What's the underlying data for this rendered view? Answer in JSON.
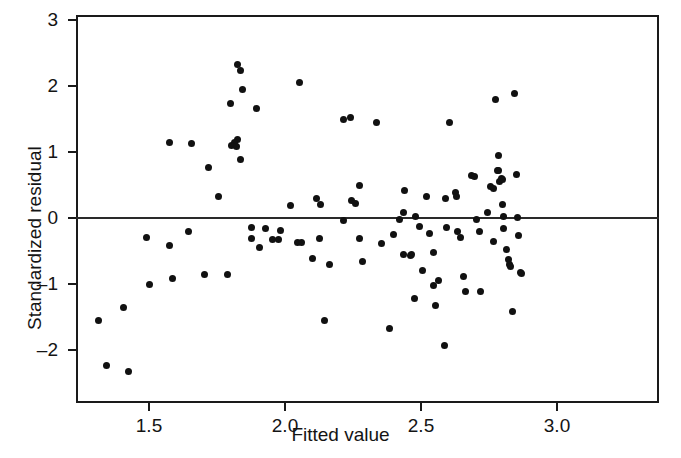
{
  "chart_data": {
    "type": "scatter",
    "title": "",
    "xlabel": "Fitted value",
    "ylabel": "Standardized residual",
    "xlim": [
      1.285,
      3.03
    ],
    "ylim": [
      -2.72,
      3.0
    ],
    "xticks": [
      1.5,
      2.0,
      2.5,
      3.0
    ],
    "xtick_labels": [
      "1.5",
      "2.0",
      "2.5",
      "3.0"
    ],
    "yticks": [
      3,
      2,
      1,
      0,
      -1,
      -2
    ],
    "ytick_labels": [
      "3",
      "2",
      "1",
      "0",
      "–1",
      "–2"
    ],
    "grid": false,
    "legend": null,
    "reference_lines": [
      {
        "axis": "y",
        "value": 0
      }
    ],
    "marker": {
      "shape": "circle",
      "color": "#111111",
      "size": 7
    },
    "n_points": 110,
    "points": [
      [
        1.315,
        -1.55
      ],
      [
        1.345,
        -2.23
      ],
      [
        1.425,
        -2.32
      ],
      [
        1.405,
        -1.36
      ],
      [
        1.49,
        -0.3
      ],
      [
        1.5,
        -1.01
      ],
      [
        1.575,
        1.14
      ],
      [
        1.575,
        -0.42
      ],
      [
        1.585,
        -0.91
      ],
      [
        1.655,
        1.13
      ],
      [
        1.645,
        -0.21
      ],
      [
        1.705,
        -0.86
      ],
      [
        1.72,
        0.76
      ],
      [
        1.755,
        0.33
      ],
      [
        1.79,
        -0.86
      ],
      [
        1.825,
        2.33
      ],
      [
        1.835,
        2.24
      ],
      [
        1.845,
        1.94
      ],
      [
        1.8,
        1.73
      ],
      [
        1.825,
        1.19
      ],
      [
        1.815,
        1.14
      ],
      [
        1.805,
        1.1
      ],
      [
        1.82,
        1.09
      ],
      [
        1.835,
        0.88
      ],
      [
        1.895,
        1.66
      ],
      [
        1.875,
        -0.14
      ],
      [
        1.875,
        -0.31
      ],
      [
        1.905,
        -0.45
      ],
      [
        1.93,
        -0.16
      ],
      [
        1.955,
        -0.33
      ],
      [
        1.975,
        -0.33
      ],
      [
        1.985,
        -0.19
      ],
      [
        2.02,
        0.19
      ],
      [
        2.055,
        2.05
      ],
      [
        2.045,
        -0.37
      ],
      [
        2.06,
        -0.37
      ],
      [
        2.1,
        -0.62
      ],
      [
        2.125,
        -0.31
      ],
      [
        2.115,
        0.29
      ],
      [
        2.13,
        0.21
      ],
      [
        2.145,
        -1.56
      ],
      [
        2.165,
        -0.7
      ],
      [
        2.215,
        1.5
      ],
      [
        2.24,
        1.52
      ],
      [
        2.215,
        -0.04
      ],
      [
        2.245,
        0.27
      ],
      [
        2.26,
        0.22
      ],
      [
        2.275,
        0.49
      ],
      [
        2.275,
        -0.31
      ],
      [
        2.285,
        -0.66
      ],
      [
        2.335,
        1.44
      ],
      [
        2.355,
        -0.39
      ],
      [
        2.385,
        -1.68
      ],
      [
        2.4,
        -0.25
      ],
      [
        2.42,
        -0.03
      ],
      [
        2.435,
        0.09
      ],
      [
        2.44,
        0.42
      ],
      [
        2.435,
        -0.55
      ],
      [
        2.46,
        -0.57
      ],
      [
        2.465,
        -0.55
      ],
      [
        2.475,
        -1.22
      ],
      [
        2.48,
        0.02
      ],
      [
        2.495,
        -0.13
      ],
      [
        2.505,
        -0.8
      ],
      [
        2.52,
        0.33
      ],
      [
        2.53,
        -0.24
      ],
      [
        2.545,
        -0.52
      ],
      [
        2.545,
        -1.02
      ],
      [
        2.555,
        -1.33
      ],
      [
        2.565,
        -0.95
      ],
      [
        2.585,
        -1.93
      ],
      [
        2.59,
        0.29
      ],
      [
        2.595,
        -0.15
      ],
      [
        2.605,
        1.44
      ],
      [
        2.625,
        0.38
      ],
      [
        2.63,
        0.33
      ],
      [
        2.635,
        -0.21
      ],
      [
        2.645,
        -0.3
      ],
      [
        2.655,
        -0.88
      ],
      [
        2.665,
        -1.11
      ],
      [
        2.685,
        0.64
      ],
      [
        2.695,
        0.63
      ],
      [
        2.705,
        -0.02
      ],
      [
        2.715,
        -0.21
      ],
      [
        2.72,
        -1.12
      ],
      [
        2.745,
        0.08
      ],
      [
        2.755,
        0.47
      ],
      [
        2.765,
        0.44
      ],
      [
        2.765,
        -0.35
      ],
      [
        2.775,
        1.8
      ],
      [
        2.78,
        0.72
      ],
      [
        2.785,
        0.72
      ],
      [
        2.785,
        0.94
      ],
      [
        2.79,
        0.55
      ],
      [
        2.795,
        0.6
      ],
      [
        2.8,
        0.58
      ],
      [
        2.8,
        0.2
      ],
      [
        2.805,
        0.02
      ],
      [
        2.805,
        -0.16
      ],
      [
        2.815,
        -0.48
      ],
      [
        2.82,
        -0.63
      ],
      [
        2.825,
        -0.71
      ],
      [
        2.83,
        -0.73
      ],
      [
        2.835,
        -1.41
      ],
      [
        2.845,
        1.88
      ],
      [
        2.85,
        0.66
      ],
      [
        2.855,
        0.01
      ],
      [
        2.86,
        -0.26
      ],
      [
        2.865,
        -0.82
      ],
      [
        2.87,
        -0.84
      ]
    ]
  },
  "axes": {
    "x_title": "Fitted value",
    "y_title": "Standardized residual"
  }
}
